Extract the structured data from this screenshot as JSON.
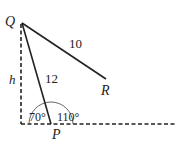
{
  "diagram": {
    "points": {
      "Q": {
        "label": "Q",
        "x": 22,
        "y": 23
      },
      "R": {
        "label": "R",
        "x": 106,
        "y": 79
      },
      "P": {
        "label": "P",
        "x": 51,
        "y": 124
      },
      "foot": {
        "x": 21,
        "y": 124
      }
    },
    "segments": {
      "QR": {
        "label": "10"
      },
      "QP": {
        "label": "12"
      },
      "height": {
        "label": "h"
      }
    },
    "angles": {
      "left": {
        "label": "70°"
      },
      "right": {
        "label": "110°"
      }
    },
    "colors": {
      "line": "#222222",
      "arc": "#555555"
    }
  }
}
